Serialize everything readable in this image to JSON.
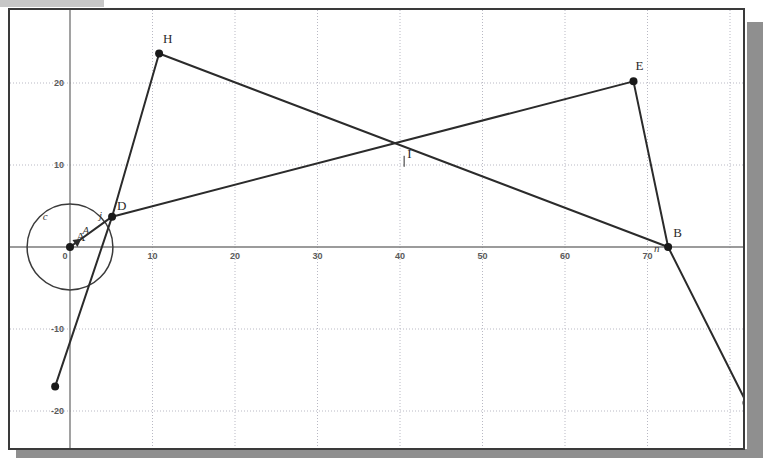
{
  "window": {
    "title_strip_color": "#b4b4b4",
    "canvas_background": "#ffffff",
    "border_color": "#3a3a3a",
    "shadow_color": "#8f8f8f"
  },
  "chart_data": {
    "type": "scatter",
    "title": "",
    "xlabel": "",
    "ylabel": "",
    "xlim": [
      -8,
      81
    ],
    "ylim": [
      -24,
      29
    ],
    "grid": true,
    "grid_spacing": 10,
    "axes": {
      "x_ticks": [
        0,
        10,
        20,
        30,
        40,
        50,
        60,
        70
      ],
      "x_tick_labels": [
        "0",
        "10",
        "20",
        "30",
        "40",
        "50",
        "60",
        "70"
      ],
      "y_ticks": [
        -20,
        -10,
        10,
        20
      ],
      "y_tick_labels": [
        "-20",
        "-10",
        "10",
        "20"
      ],
      "origin_label": "0"
    },
    "points": [
      {
        "name": "A",
        "label": "A",
        "x": 0,
        "y": 0,
        "label_dx": 6,
        "label_dy": -6
      },
      {
        "name": "D",
        "label": "D",
        "x": 5.1,
        "y": 3.7,
        "label_dx": 5,
        "label_dy": -7
      },
      {
        "name": "H",
        "label": "H",
        "x": 10.8,
        "y": 23.6,
        "label_dx": 4,
        "label_dy": -10
      },
      {
        "name": "E",
        "label": "E",
        "x": 68.3,
        "y": 20.2,
        "label_dx": 2,
        "label_dy": -11
      },
      {
        "name": "B",
        "label": "B",
        "x": 72.5,
        "y": 0,
        "label_dx": 5,
        "label_dy": -10
      },
      {
        "name": "J",
        "label": "J",
        "x": 82.0,
        "y": -19.0,
        "label_dx": 6,
        "label_dy": -7
      },
      {
        "name": "K",
        "label": "",
        "x": -1.8,
        "y": -17.0,
        "label_dx": 0,
        "label_dy": 0
      }
    ],
    "intersection_point": {
      "name": "I",
      "label": "I",
      "x": 40.5,
      "y": 11.0,
      "label_dx": 1,
      "label_dy": -3
    },
    "segments": [
      {
        "name": "segment-H-D",
        "from": "H",
        "to": "D"
      },
      {
        "name": "segment-H-B",
        "from": "H",
        "to": "B"
      },
      {
        "name": "segment-D-E",
        "from": "D",
        "to": "E"
      },
      {
        "name": "segment-E-B",
        "from": "E",
        "to": "B"
      },
      {
        "name": "segment-B-J",
        "from": "B",
        "to": "J"
      },
      {
        "name": "segment-D-K",
        "from": "D",
        "to": "K"
      },
      {
        "name": "radius-A-D",
        "from": "A",
        "to": "D"
      }
    ],
    "circle": {
      "name": "c",
      "label": "c",
      "center": "A",
      "center_x": 0,
      "center_y": 0,
      "radius": 5.2,
      "label_x": -3.3,
      "label_y": 3.3
    },
    "object_labels": [
      {
        "name": "label-c",
        "text": "c",
        "x": -3.3,
        "y": 3.3
      },
      {
        "name": "label-j",
        "text": "j",
        "x": 3.5,
        "y": 3.4
      },
      {
        "name": "label-A",
        "text": "A",
        "x": 1.5,
        "y": 1.6
      },
      {
        "name": "label-n",
        "text": "n",
        "x": 70.8,
        "y": -0.6
      }
    ],
    "styles": {
      "line_color": "#2b2b2b",
      "point_color": "#1a1a1a",
      "axis_color": "#7a7a7a",
      "grid_color": "#b9b9c4",
      "circle_color": "#3b3b3b"
    }
  }
}
